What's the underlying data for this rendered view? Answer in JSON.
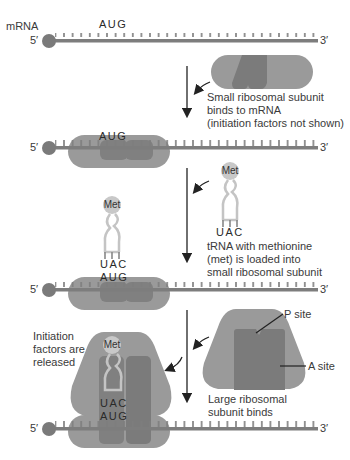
{
  "labels": {
    "mrna": "mRNA",
    "five_prime": "5′",
    "three_prime": "3′",
    "aug": "AUG",
    "uac": "UAC",
    "met": "Met",
    "p_site": "P site",
    "a_site": "A site"
  },
  "steps": [
    {
      "id": "step1",
      "caption_lines": [
        "Small ribosomal subunit",
        "binds to mRNA",
        "(initiation factors not shown)"
      ]
    },
    {
      "id": "step2",
      "caption_lines": [
        "tRNA with methionine",
        "(met) is loaded into",
        "small ribosomal subunit"
      ]
    },
    {
      "id": "step3",
      "caption_lines": [
        "Large ribosomal",
        "subunit binds"
      ]
    },
    {
      "id": "step4",
      "caption_lines": [
        "Initiation",
        "factors are",
        "released"
      ]
    }
  ],
  "colors": {
    "mrna": "#7d7d7d",
    "subunit_light": "#9a9a9a",
    "subunit_dark": "#7b7b7b",
    "met_ball": "#c8c8c8",
    "trna": "#c4c4c4",
    "arrow": "#222222"
  }
}
